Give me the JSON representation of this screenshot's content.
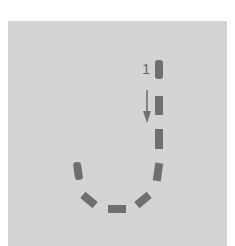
{
  "diagram": {
    "step_label": "1",
    "colors": {
      "background": "#ffffff",
      "panel": "#d4d4d4",
      "path": "#6f6f6f",
      "arrow": "#707070",
      "label": "#6a6a6a"
    }
  }
}
